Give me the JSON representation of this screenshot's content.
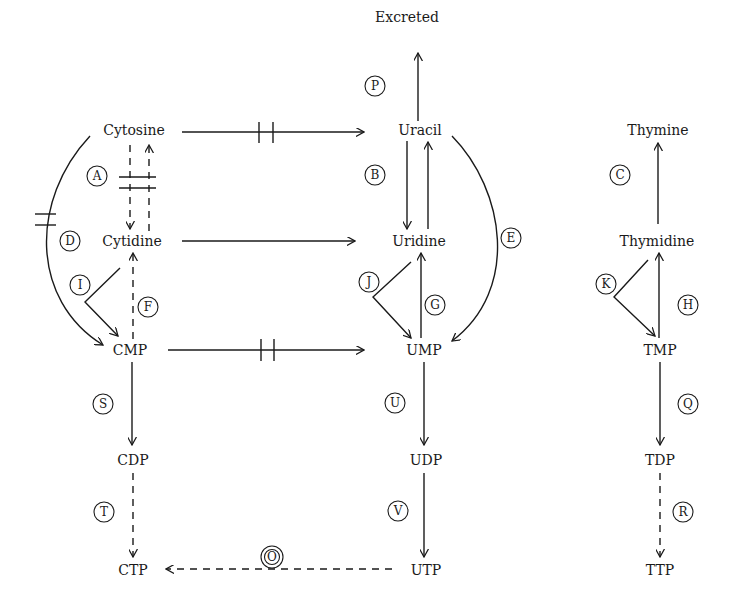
{
  "diagram": {
    "nodes": {
      "excreted": "Excreted",
      "cytosine": "Cytosine",
      "uracil": "Uracil",
      "thymine": "Thymine",
      "cytidine": "Cytidine",
      "uridine": "Uridine",
      "thymidine": "Thymidine",
      "cmp": "CMP",
      "ump": "UMP",
      "tmp": "TMP",
      "cdp": "CDP",
      "udp": "UDP",
      "tdp": "TDP",
      "ctp": "CTP",
      "utp": "UTP",
      "ttp": "TTP"
    },
    "reaction_labels": {
      "A": "A",
      "B": "B",
      "C": "C",
      "D": "D",
      "E": "E",
      "F": "F",
      "G": "G",
      "H": "H",
      "I": "I",
      "J": "J",
      "K": "K",
      "O": "O",
      "P": "P",
      "Q": "Q",
      "R": "R",
      "S": "S",
      "T": "T",
      "U": "U",
      "V": "V"
    },
    "edges": [
      {
        "from": "Uracil",
        "to": "Excreted",
        "label": "P",
        "style": "solid"
      },
      {
        "from": "Cytosine",
        "to": "Uracil",
        "label": "",
        "style": "solid",
        "blocked": true
      },
      {
        "from": "Cytosine",
        "to": "Cytidine",
        "label": "A",
        "style": "dashed",
        "blocked": true
      },
      {
        "from": "Cytidine",
        "to": "Cytosine",
        "label": "A",
        "style": "dashed",
        "blocked": true
      },
      {
        "from": "Cytosine",
        "to": "CMP",
        "label": "D",
        "style": "solid",
        "blocked": true
      },
      {
        "from": "Cytidine",
        "to": "Uridine",
        "label": "",
        "style": "solid"
      },
      {
        "from": "Cytidine",
        "to": "CMP",
        "label": "I",
        "style": "solid"
      },
      {
        "from": "CMP",
        "to": "Cytidine",
        "label": "F",
        "style": "dashed"
      },
      {
        "from": "CMP",
        "to": "UMP",
        "label": "",
        "style": "solid",
        "blocked": true
      },
      {
        "from": "Uracil",
        "to": "Uridine",
        "label": "B",
        "style": "solid"
      },
      {
        "from": "Uridine",
        "to": "Uracil",
        "label": "B",
        "style": "solid"
      },
      {
        "from": "Uracil",
        "to": "UMP",
        "label": "E",
        "style": "solid"
      },
      {
        "from": "Uridine",
        "to": "UMP",
        "label": "J",
        "style": "solid"
      },
      {
        "from": "UMP",
        "to": "Uridine",
        "label": "G",
        "style": "solid"
      },
      {
        "from": "Thymidine",
        "to": "Thymine",
        "label": "C",
        "style": "solid"
      },
      {
        "from": "Thymidine",
        "to": "TMP",
        "label": "K",
        "style": "solid"
      },
      {
        "from": "TMP",
        "to": "Thymidine",
        "label": "H",
        "style": "solid"
      },
      {
        "from": "CMP",
        "to": "CDP",
        "label": "S",
        "style": "solid"
      },
      {
        "from": "CDP",
        "to": "CTP",
        "label": "T",
        "style": "dashed"
      },
      {
        "from": "UMP",
        "to": "UDP",
        "label": "U",
        "style": "solid"
      },
      {
        "from": "UDP",
        "to": "UTP",
        "label": "V",
        "style": "solid"
      },
      {
        "from": "UTP",
        "to": "CTP",
        "label": "O",
        "style": "dashed"
      },
      {
        "from": "TMP",
        "to": "TDP",
        "label": "Q",
        "style": "solid"
      },
      {
        "from": "TDP",
        "to": "TTP",
        "label": "R",
        "style": "dashed"
      }
    ]
  }
}
